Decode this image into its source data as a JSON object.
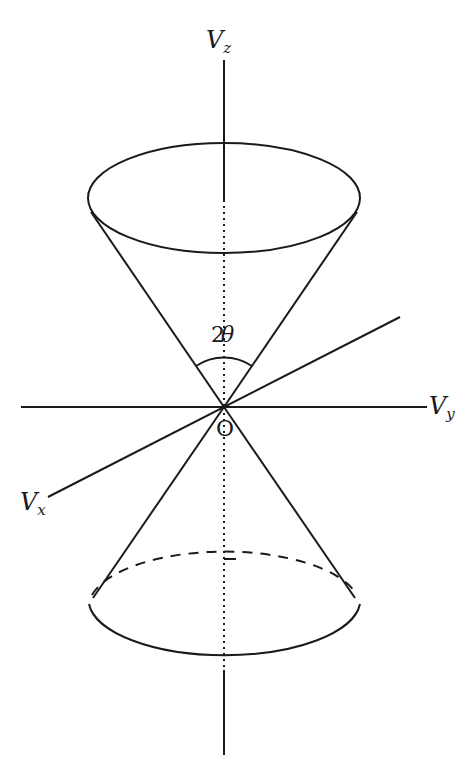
{
  "diagram": {
    "type": "double cone (velocity space)",
    "labels": {
      "vz_main": "V",
      "vz_sub": "z",
      "vy_main": "V",
      "vy_sub": "y",
      "vx_main": "V",
      "vx_sub": "x",
      "angle_num": "2",
      "angle_sym": "θ",
      "origin": "O"
    },
    "colors": {
      "stroke": "#1a1a1a",
      "background": "#ffffff"
    }
  }
}
